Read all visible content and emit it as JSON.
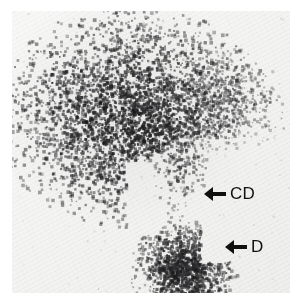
{
  "figure": {
    "kind": "autoradiograph",
    "caption_present": false,
    "background_color": "#f1f1f0",
    "spot_color": "#141414",
    "annotation_color": "#101010"
  },
  "annotations": [
    {
      "id": "cd",
      "label": "CD",
      "arrow_icon": "left-arrow-icon",
      "arrow_direction": "left",
      "points_to": "upper-trailing-spot",
      "x": 192,
      "y": 174
    },
    {
      "id": "d",
      "label": "D",
      "arrow_icon": "left-arrow-icon",
      "arrow_direction": "left",
      "points_to": "lower-spot",
      "x": 213,
      "y": 227
    }
  ],
  "spots": [
    {
      "id": "main-mass",
      "name": "large-upper-spot",
      "center_x": 120,
      "center_y": 105,
      "radius_x": 68,
      "radius_y": 55,
      "intensity": "very-dark",
      "density": 4200
    },
    {
      "id": "right-streak",
      "name": "right-trailing-streak",
      "center_x": 205,
      "center_y": 88,
      "radius_x": 45,
      "radius_y": 26,
      "intensity": "medium",
      "density": 900
    },
    {
      "id": "cd-tail",
      "name": "cd-descending-tail",
      "center_x": 168,
      "center_y": 152,
      "radius_x": 16,
      "radius_y": 28,
      "intensity": "medium-dark",
      "density": 420
    },
    {
      "id": "dotted-trail",
      "name": "faint-dotted-trail",
      "center_x": 166,
      "center_y": 200,
      "radius_x": 7,
      "radius_y": 24,
      "intensity": "faint",
      "density": 45
    },
    {
      "id": "d-spot",
      "name": "lower-compact-spot",
      "center_x": 172,
      "center_y": 258,
      "radius_x": 27,
      "radius_y": 25,
      "intensity": "very-dark",
      "density": 1500
    }
  ],
  "plate": {
    "left": 12,
    "top": 11,
    "width": 278,
    "height": 282
  }
}
